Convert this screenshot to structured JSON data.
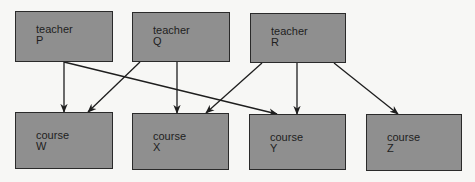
{
  "diagram": {
    "teachers": [
      {
        "id": "P",
        "type": "teacher",
        "name": "P",
        "box": {
          "x": 15,
          "y": 11,
          "w": 98,
          "h": 51
        }
      },
      {
        "id": "Q",
        "type": "teacher",
        "name": "Q",
        "box": {
          "x": 132,
          "y": 12,
          "w": 98,
          "h": 50
        }
      },
      {
        "id": "R",
        "type": "teacher",
        "name": "R",
        "box": {
          "x": 250,
          "y": 13,
          "w": 96,
          "h": 50
        }
      }
    ],
    "courses": [
      {
        "id": "W",
        "type": "course",
        "name": "W",
        "box": {
          "x": 15,
          "y": 112,
          "w": 98,
          "h": 57
        }
      },
      {
        "id": "X",
        "type": "course",
        "name": "X",
        "box": {
          "x": 132,
          "y": 113,
          "w": 97,
          "h": 57
        }
      },
      {
        "id": "Y",
        "type": "course",
        "name": "Y",
        "box": {
          "x": 249,
          "y": 114,
          "w": 97,
          "h": 56
        }
      },
      {
        "id": "Z",
        "type": "course",
        "name": "Z",
        "box": {
          "x": 366,
          "y": 114,
          "w": 96,
          "h": 57
        }
      }
    ],
    "edges": [
      {
        "from": "P",
        "to": "W",
        "x1": 64,
        "y1": 62,
        "x2": 64,
        "y2": 112
      },
      {
        "from": "P",
        "to": "Y",
        "x1": 64,
        "y1": 62,
        "x2": 277,
        "y2": 114
      },
      {
        "from": "Q",
        "to": "W",
        "x1": 140,
        "y1": 62,
        "x2": 88,
        "y2": 112
      },
      {
        "from": "Q",
        "to": "X",
        "x1": 177,
        "y1": 62,
        "x2": 177,
        "y2": 113
      },
      {
        "from": "R",
        "to": "X",
        "x1": 262,
        "y1": 63,
        "x2": 206,
        "y2": 113
      },
      {
        "from": "R",
        "to": "Y",
        "x1": 297,
        "y1": 63,
        "x2": 297,
        "y2": 114
      },
      {
        "from": "R",
        "to": "Z",
        "x1": 334,
        "y1": 63,
        "x2": 398,
        "y2": 114
      }
    ]
  },
  "labels": {
    "teacher": "teacher",
    "course": "course"
  },
  "colors": {
    "node_fill": "#8f8f8f",
    "node_border": "#2a2a2a",
    "edge": "#1e1e1e",
    "background": "#f7f7f5"
  }
}
